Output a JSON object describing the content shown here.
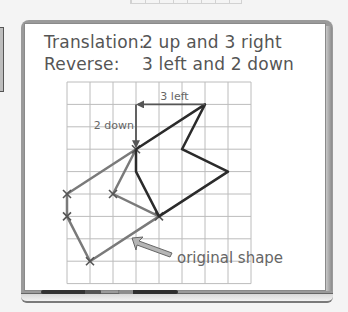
{
  "board": {
    "translation_label": "Translation:",
    "translation_value": "2 up and 3 right",
    "reverse_label": "Reverse:",
    "reverse_value": "3 left and 2 down"
  },
  "grid": {
    "columns": 8,
    "rows": 9
  },
  "diagram": {
    "colors": {
      "translated_shape": "#2b2b2b",
      "original_shape": "#7a7a7a",
      "move_arrows": "#555555",
      "callout_arrow_fill": "#b5b5b5"
    },
    "translated_shape": {
      "name": "translated shape",
      "vertices": [
        [
          3,
          3
        ],
        [
          6,
          1
        ],
        [
          5,
          3
        ],
        [
          7,
          4
        ],
        [
          4,
          6
        ],
        [
          3,
          4
        ],
        [
          3,
          3
        ]
      ]
    },
    "original_shape": {
      "name": "original shape",
      "vertices": [
        [
          3,
          3
        ],
        [
          0,
          5
        ],
        [
          0,
          6
        ],
        [
          1,
          8
        ],
        [
          4,
          6
        ],
        [
          2,
          5
        ],
        [
          3,
          3
        ]
      ],
      "marked_vertices": [
        [
          3,
          3
        ],
        [
          0,
          5
        ],
        [
          0,
          6
        ],
        [
          1,
          8
        ],
        [
          4,
          6
        ],
        [
          2,
          5
        ]
      ]
    },
    "move_left": {
      "from": [
        6,
        1
      ],
      "to": [
        3,
        1
      ],
      "label": "3 left"
    },
    "move_down": {
      "from": [
        3,
        1
      ],
      "to": [
        3,
        3
      ],
      "label": "2 down"
    },
    "callout": {
      "label": "original shape"
    }
  }
}
